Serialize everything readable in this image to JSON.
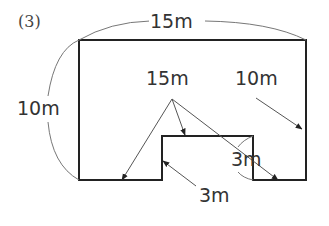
{
  "problem_number": "(3)",
  "shape": {
    "description": "Rectangle 15m by 10m with a rectangular notch cut from the bottom edge",
    "outer_width": "15m",
    "outer_height": "10m",
    "notch_height": "3m",
    "notch_width": "3m"
  },
  "labels": {
    "top_width": "15m",
    "left_height": "10m",
    "center_sum": "15m",
    "right_height": "10m",
    "notch_height": "3m",
    "notch_width": "3m"
  },
  "colors": {
    "line": "#222222",
    "thin_line": "#777777",
    "text": "#333333"
  }
}
